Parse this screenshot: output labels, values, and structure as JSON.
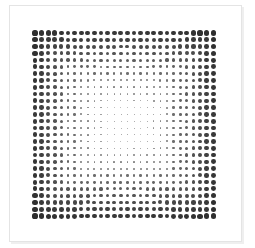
{
  "figure": {
    "grid": {
      "cols": 28,
      "rows": 28,
      "origin_x": 35,
      "origin_y": 33,
      "pitch_x": 6.6,
      "pitch_y": 6.78,
      "max_diameter": 5.2,
      "min_diameter": 0.3,
      "dot_color": "#2e2e2e"
    },
    "frame": {
      "border_color": "#e4e4e4",
      "background": "#ffffff"
    }
  }
}
